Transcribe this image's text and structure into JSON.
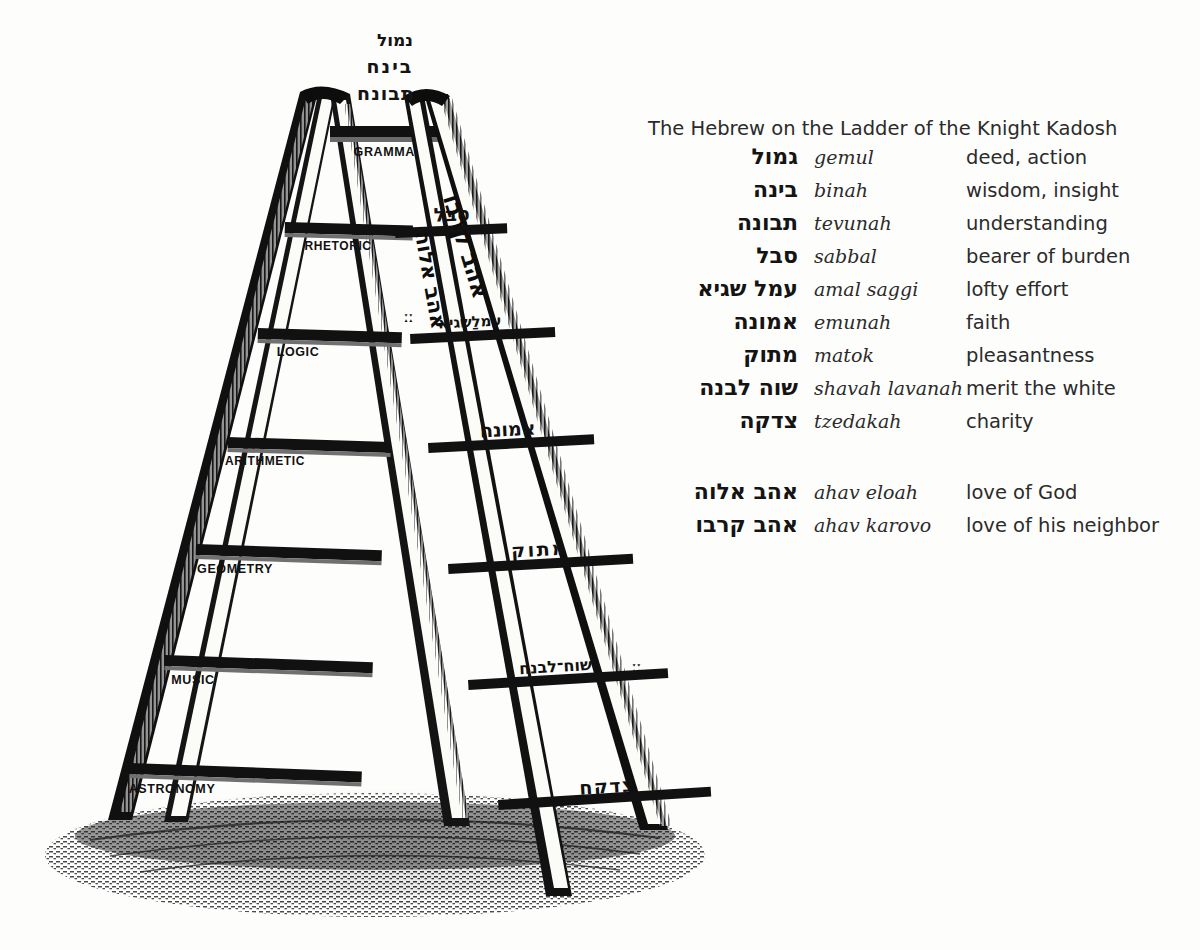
{
  "illustration": {
    "name": "ladder-of-the-knight-kadosh-engraving",
    "top_hebrew": [
      {
        "text": "נמול"
      },
      {
        "text": "בינח"
      },
      {
        "text": "תבונח"
      }
    ],
    "left_ladder": {
      "name": "liberal-arts-ladder",
      "rungs": [
        {
          "label": "GRAMMAR"
        },
        {
          "label": "RHETORIC"
        },
        {
          "label": "LOGIC"
        },
        {
          "label": "ARITHMETIC"
        },
        {
          "label": "GEOMETRY"
        },
        {
          "label": "MUSIC"
        },
        {
          "label": "ASTRONOMY"
        }
      ]
    },
    "right_ladder": {
      "name": "hebrew-virtues-ladder",
      "rungs": [
        {
          "label": "סבל"
        },
        {
          "label": "עמלַשגיא"
        },
        {
          "label": "אמונח"
        },
        {
          "label": "מתוק"
        },
        {
          "label": "שוח־לבנח"
        },
        {
          "label": "צדקח"
        }
      ],
      "left_rail_hebrew": "אהב אלוה",
      "right_rail_hebrew": "אהב קרבו"
    }
  },
  "glossary": {
    "title": "The Hebrew on the Ladder of the Knight Kadosh",
    "rows": [
      {
        "hebrew": "גמול",
        "translit": "gemul",
        "english": "deed, action"
      },
      {
        "hebrew": "בינה",
        "translit": "binah",
        "english": "wisdom, insight"
      },
      {
        "hebrew": "תבונה",
        "translit": "tevunah",
        "english": "understanding"
      },
      {
        "hebrew": "סבל",
        "translit": "sabbal",
        "english": "bearer of burden"
      },
      {
        "hebrew": "עמל שגיא",
        "translit": "amal saggi",
        "english": "lofty effort"
      },
      {
        "hebrew": "אמונה",
        "translit": "emunah",
        "english": "faith"
      },
      {
        "hebrew": "מתוק",
        "translit": "matok",
        "english": "pleasantness"
      },
      {
        "hebrew": "שוה לבנה",
        "translit": "shavah lavanah",
        "english": "merit the white"
      },
      {
        "hebrew": "צדקה",
        "translit": "tzedakah",
        "english": "charity"
      }
    ],
    "rows2": [
      {
        "hebrew": "אהב אלוה",
        "translit": "ahav eloah",
        "english": "love of God"
      },
      {
        "hebrew": "אהב קרבו",
        "translit": "ahav karovo",
        "english": "love of his neighbor"
      }
    ]
  },
  "colors": {
    "ink": "#111111",
    "paper": "#fdfdfc",
    "shadow": "#3a3a3a"
  }
}
